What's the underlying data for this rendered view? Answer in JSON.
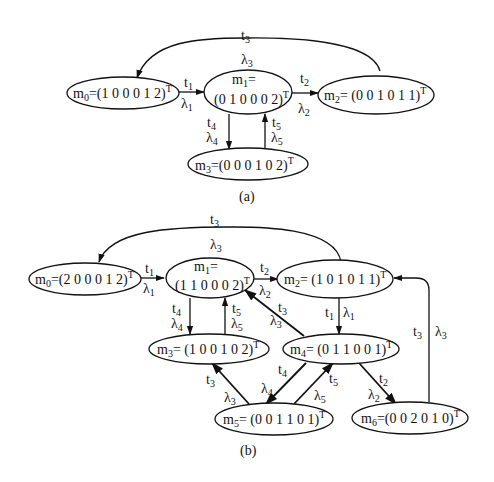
{
  "diagrams": {
    "a": {
      "caption": "(a)",
      "nodes": {
        "m0": {
          "name": "m",
          "sub": "0",
          "vector": "=(1 0 0 0 1 2)",
          "sup": "T"
        },
        "m1": {
          "name": "m",
          "sub": "1",
          "line1": "=",
          "vector": "(0 1 0 0 0 2)",
          "sup": "T"
        },
        "m2": {
          "name": "m",
          "sub": "2",
          "vector": "= (0 0 1 0 1 1)",
          "sup": "T"
        },
        "m3": {
          "name": "m",
          "sub": "3",
          "vector": "=(0 0 0 1 0 2)",
          "sup": "T"
        }
      },
      "edges": [
        {
          "from": "m0",
          "to": "m1",
          "t": "t",
          "t_sub": "1",
          "lambda": "λ",
          "lambda_sub": "1"
        },
        {
          "from": "m1",
          "to": "m2",
          "t": "t",
          "t_sub": "2",
          "lambda": "λ",
          "lambda_sub": "2"
        },
        {
          "from": "m2",
          "to": "m0",
          "t": "t",
          "t_sub": "3",
          "lambda": "λ",
          "lambda_sub": "3"
        },
        {
          "from": "m1",
          "to": "m3",
          "t": "t",
          "t_sub": "4",
          "lambda": "λ",
          "lambda_sub": "4"
        },
        {
          "from": "m3",
          "to": "m1",
          "t": "t",
          "t_sub": "5",
          "lambda": "λ",
          "lambda_sub": "5"
        }
      ]
    },
    "b": {
      "caption": "(b)",
      "nodes": {
        "m0": {
          "name": "m",
          "sub": "0",
          "vector": "=(2 0 0 0 1 2)",
          "sup": "T"
        },
        "m1": {
          "name": "m",
          "sub": "1",
          "line1": "=",
          "vector": "(1 1 0 0 0 2)",
          "sup": "T"
        },
        "m2": {
          "name": "m",
          "sub": "2",
          "vector": "= (1 0 1 0 1 1)",
          "sup": "T"
        },
        "m3": {
          "name": "m",
          "sub": "3",
          "vector": "= (1 0 0 1 0 2)",
          "sup": "T"
        },
        "m4": {
          "name": "m",
          "sub": "4",
          "vector": "= (0 1 1 0 0 1)",
          "sup": "T"
        },
        "m5": {
          "name": "m",
          "sub": "5",
          "vector": "= (0 0 1 1 0 1)",
          "sup": "T"
        },
        "m6": {
          "name": "m",
          "sub": "6",
          "vector": "=(0 0 2 0 1 0)",
          "sup": "T"
        }
      },
      "edges": [
        {
          "from": "m0",
          "to": "m1",
          "t": "t",
          "t_sub": "1",
          "lambda": "λ",
          "lambda_sub": "1"
        },
        {
          "from": "m1",
          "to": "m2",
          "t": "t",
          "t_sub": "2",
          "lambda": "λ",
          "lambda_sub": "2"
        },
        {
          "from": "m2",
          "to": "m0",
          "t": "t",
          "t_sub": "3",
          "lambda": "λ",
          "lambda_sub": "3"
        },
        {
          "from": "m1",
          "to": "m3",
          "t": "t",
          "t_sub": "4",
          "lambda": "λ",
          "lambda_sub": "4"
        },
        {
          "from": "m3",
          "to": "m1",
          "t": "t",
          "t_sub": "5",
          "lambda": "λ",
          "lambda_sub": "5"
        },
        {
          "from": "m4",
          "to": "m1",
          "t": "t",
          "t_sub": "3",
          "lambda": "λ",
          "lambda_sub": "3"
        },
        {
          "from": "m2",
          "to": "m4",
          "t": "t",
          "t_sub": "1",
          "lambda": "λ",
          "lambda_sub": "1"
        },
        {
          "from": "m6",
          "to": "m2",
          "t": "t",
          "t_sub": "3",
          "lambda": "λ",
          "lambda_sub": "3"
        },
        {
          "from": "m5",
          "to": "m3",
          "t": "t",
          "t_sub": "3",
          "lambda": "λ",
          "lambda_sub": "3"
        },
        {
          "from": "m4",
          "to": "m5",
          "t": "t",
          "t_sub": "4",
          "lambda": "λ",
          "lambda_sub": "4"
        },
        {
          "from": "m5",
          "to": "m4",
          "t": "t",
          "t_sub": "5",
          "lambda": "λ",
          "lambda_sub": "5"
        },
        {
          "from": "m4",
          "to": "m6",
          "t": "t",
          "t_sub": "2",
          "lambda": "λ",
          "lambda_sub": "2"
        }
      ]
    }
  }
}
